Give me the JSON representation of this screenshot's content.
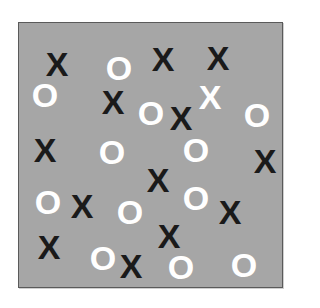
{
  "board": {
    "background_color": "#a6a6a6",
    "border_color": "#5a5a5a"
  },
  "colors": {
    "x": "#1a1a1a",
    "o": "#ffffff",
    "x_highlight": "#ffffff"
  },
  "symbols": [
    {
      "char": "X",
      "type": "x",
      "x": 57,
      "y": 64
    },
    {
      "char": "O",
      "type": "o",
      "x": 119,
      "y": 68
    },
    {
      "char": "X",
      "type": "x",
      "x": 163,
      "y": 59
    },
    {
      "char": "X",
      "type": "x",
      "x": 218,
      "y": 58
    },
    {
      "char": "O",
      "type": "o",
      "x": 45,
      "y": 95
    },
    {
      "char": "X",
      "type": "x",
      "x": 113,
      "y": 102
    },
    {
      "char": "O",
      "type": "o",
      "x": 151,
      "y": 113
    },
    {
      "char": "X",
      "type": "x",
      "x": 181,
      "y": 118
    },
    {
      "char": "X",
      "type": "x-white",
      "x": 210,
      "y": 97
    },
    {
      "char": "O",
      "type": "o",
      "x": 257,
      "y": 115
    },
    {
      "char": "X",
      "type": "x",
      "x": 45,
      "y": 150
    },
    {
      "char": "O",
      "type": "o",
      "x": 112,
      "y": 152
    },
    {
      "char": "O",
      "type": "o",
      "x": 196,
      "y": 150
    },
    {
      "char": "X",
      "type": "x",
      "x": 265,
      "y": 161
    },
    {
      "char": "X",
      "type": "x",
      "x": 158,
      "y": 180
    },
    {
      "char": "O",
      "type": "o",
      "x": 48,
      "y": 202
    },
    {
      "char": "X",
      "type": "x",
      "x": 82,
      "y": 206
    },
    {
      "char": "O",
      "type": "o",
      "x": 130,
      "y": 212
    },
    {
      "char": "O",
      "type": "o",
      "x": 196,
      "y": 198
    },
    {
      "char": "X",
      "type": "x",
      "x": 230,
      "y": 212
    },
    {
      "char": "X",
      "type": "x",
      "x": 169,
      "y": 236
    },
    {
      "char": "X",
      "type": "x",
      "x": 49,
      "y": 247
    },
    {
      "char": "O",
      "type": "o",
      "x": 103,
      "y": 258
    },
    {
      "char": "X",
      "type": "x",
      "x": 131,
      "y": 266
    },
    {
      "char": "O",
      "type": "o",
      "x": 181,
      "y": 267
    },
    {
      "char": "O",
      "type": "o",
      "x": 244,
      "y": 265
    }
  ]
}
